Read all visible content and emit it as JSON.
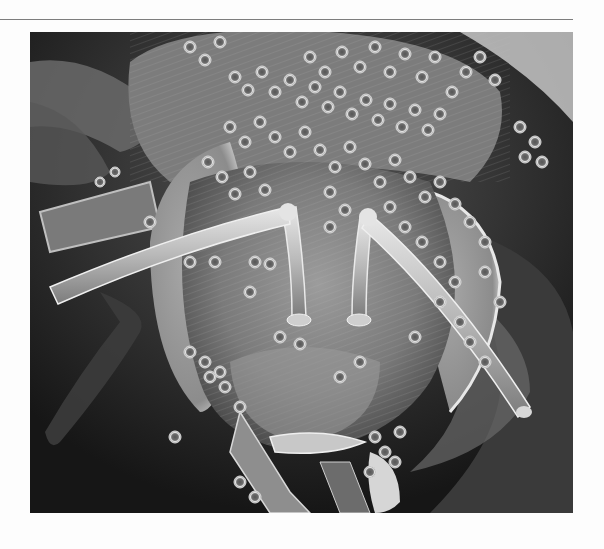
{
  "page": {
    "background": "#fdfdfd",
    "rule_color": "#7d7d7d"
  },
  "figure": {
    "type": "scanning electron micrograph",
    "subject": "Frontal view of a bee head covered in pollen grains",
    "palette": {
      "background_dark": "#1c1c1c",
      "head_mid": "#8a8a8a",
      "highlight": "#e6e6e6",
      "pollen_rim": "#d8d8d8",
      "pollen_core": "#5a5a5a"
    },
    "caption": ""
  }
}
